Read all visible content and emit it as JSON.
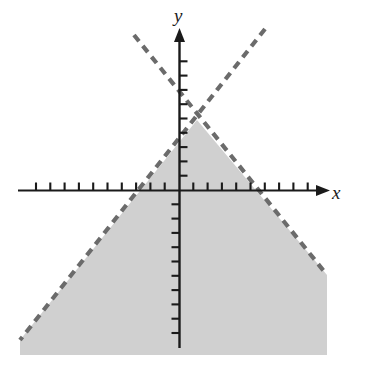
{
  "figure": {
    "title": "",
    "width": 365,
    "height": 377,
    "background_color": "#ffffff"
  },
  "axes": {
    "x_label": "x",
    "y_label": "y",
    "origin_px": {
      "x": 179,
      "y": 190
    },
    "tick_spacing_px": 14.3,
    "axis_color": "#1a1a1a",
    "x_axis_start_px": 18,
    "x_axis_end_px": 322,
    "y_axis_top_px": 33,
    "y_axis_bottom_px": 348,
    "x_ticks_left_count": 11,
    "x_ticks_right_count": 10,
    "y_ticks_up_count": 11,
    "y_ticks_down_count": 11,
    "tick_length_px": 8
  },
  "chart_data": {
    "type": "line",
    "title": "",
    "xlabel": "x",
    "ylabel": "y",
    "grid": false,
    "legend": "none",
    "xlim": [
      -11.3,
      10.0
    ],
    "ylim": [
      -11.1,
      11.0
    ],
    "shaded_region": {
      "description": "Region below and between two dashed rays forming an inverted V (apex above origin)",
      "fill_color": "#d0d0d0",
      "boundary_style": "dashed",
      "boundary_color": "#6b6b6b",
      "apex_point": {
        "x": 1.3,
        "y": 4.9
      },
      "vertices_px": [
        [
          197,
          120
        ],
        [
          327,
          275
        ],
        [
          327,
          355
        ],
        [
          20,
          355
        ],
        [
          20,
          340
        ]
      ]
    },
    "series": [
      {
        "name": "left-ray",
        "style": "dashed",
        "color": "#6b6b6b",
        "points_px": [
          [
            134,
            35
          ],
          [
            197,
            120
          ],
          [
            327,
            275
          ]
        ],
        "x_intercept": -3.0,
        "slope": 1.22
      },
      {
        "name": "right-ray",
        "style": "dashed",
        "color": "#6b6b6b",
        "points_px": [
          [
            265,
            29
          ],
          [
            197,
            120
          ],
          [
            20,
            340
          ]
        ],
        "x_intercept": 5.5,
        "slope": -1.22
      }
    ]
  }
}
